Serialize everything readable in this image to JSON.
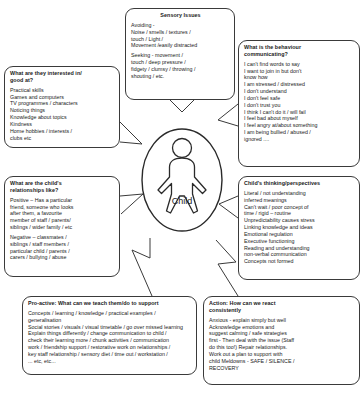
{
  "centre": {
    "label": "Child",
    "figure_icon": "child-figure-icon"
  },
  "boxes": {
    "sensory": {
      "title": "Sensory Issues",
      "paragraphs": [
        "Avoiding -\nNoise / smells / textures /\ntouch / Light /\nMovement /easily distracted",
        "Seeking - movement /\ntouch / deep pressure /\nfidgety / clumsy / throwing /\nshouting / etc."
      ]
    },
    "behaviour": {
      "title": "What is the behaviour\ncommunicating?",
      "paragraphs": [
        "I can't find words to say\nI want to join in but don't\nknow how\nI am stressed / distressed\nI don't understand\nI don't feel safe\nI don't trust you\nI think I can't do it / will fail\nI feel bad about myself\nI feel angry at/about something\nI am being bullied / abused /\nignored ...."
      ]
    },
    "interests": {
      "title": "What are they interested in/\ngood at?",
      "paragraphs": [
        "Practical skills\nGames and computers\nTV programmes / characters\nNoticing things\nKnowledge about topics\nKindness\nHome hobbies / interests /\nclubs etc"
      ]
    },
    "relationships": {
      "title": "What are the child's\nrelationships like?",
      "paragraphs": [
        "Positive – Has a particular\nfriend, someone who looks\nafter them, a favourite\nmember of staff / parents/\nsiblings / wider family / etc",
        "Negative – classmates /\nsiblings / staff members /\nparticular child / parents /\ncarers / bullying / abuse"
      ]
    },
    "thinking": {
      "title": "Child's thinking/perspectives",
      "paragraphs": [
        "Literal / not understanding\ninferred meanings\nCan't wait / poor concept of\ntime / rigid – routine\nUnpredictability causes stress\nLinking knowledge and ideas\nEmotional regulation\nExecutive functioning\nReading and understanding\nnon-verbal communication\nConcepts not formed"
      ]
    },
    "proactive": {
      "title": "Pro-active: What can we teach them/do to support",
      "paragraphs": [
        "Concepts / learning / knowledge / practical examples /\ngeneralisation\nSocial stories / visuals / visual timetable / go over missed learning\nExplain things differently / change communication to child /\ncheck their learning more / chunk activities / communication\nwork / friendship support / restorative work on relationships /\nkey staff relationship / sensory diet / time out / workstation /\n... etc, etc..."
      ]
    },
    "action": {
      "title": "Action: How can we react\nconsistently",
      "paragraphs": [
        "Anxious - explain simply but well\nAcknowledge emotions and\nsuggest calming / safe strategies\nfirst - Then deal with the issue (Staff\ndo this too!) Repair relationships.\nWork out a plan to support with\nchild Meldowns - SAFE / SILENCE /\nRECOVERY"
      ]
    }
  }
}
